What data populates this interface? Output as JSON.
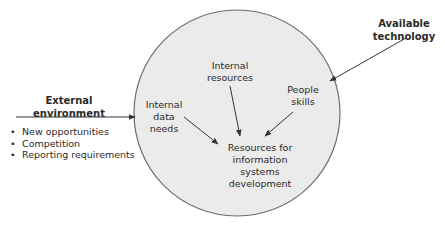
{
  "diagram": {
    "colors": {
      "circle_fill": "#ebebeb",
      "circle_stroke": "#6e6e6e",
      "arrow": "#333333",
      "text": "#2a2a2a"
    },
    "external": {
      "title_line1": "External",
      "title_line2": "environment",
      "bullets": [
        "New opportunities",
        "Competition",
        "Reporting requirements"
      ]
    },
    "technology": {
      "line1": "Available",
      "line2": "technology"
    },
    "circle": {
      "internal_data_needs": [
        "Internal",
        "data",
        "needs"
      ],
      "internal_resources": [
        "Internal",
        "resources"
      ],
      "people_skills": [
        "People",
        "skills"
      ],
      "center": [
        "Resources for",
        "information",
        "systems",
        "development"
      ]
    }
  }
}
